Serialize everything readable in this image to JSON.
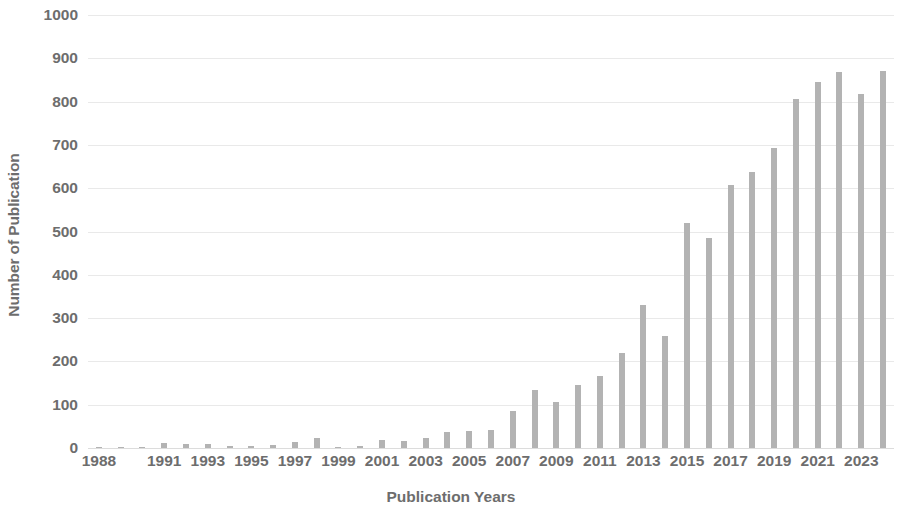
{
  "chart_data": {
    "type": "bar",
    "title": "",
    "xlabel": "Publication Years",
    "ylabel": "Number of Publication",
    "ylim": [
      0,
      1000
    ],
    "ytick_values": [
      0,
      100,
      200,
      300,
      400,
      500,
      600,
      700,
      800,
      900,
      1000
    ],
    "ytick_labels": [
      "0",
      "100",
      "200",
      "300",
      "400",
      "500",
      "600",
      "700",
      "800",
      "900",
      "1000"
    ],
    "grid": true,
    "legend": false,
    "bar_color": "#b3b3b3",
    "grid_color": "#e9e9e9",
    "text_color": "#6d6d6d",
    "categories": [
      "1988",
      "1989",
      "1990",
      "1991",
      "1992",
      "1993",
      "1994",
      "1995",
      "1996",
      "1997",
      "1998",
      "1999",
      "2000",
      "2001",
      "2002",
      "2003",
      "2004",
      "2005",
      "2006",
      "2007",
      "2008",
      "2009",
      "2010",
      "2011",
      "2012",
      "2013",
      "2014",
      "2015",
      "2016",
      "2017",
      "2018",
      "2019",
      "2020",
      "2021",
      "2022",
      "2023",
      "2024"
    ],
    "values": [
      1,
      1,
      2,
      12,
      10,
      9,
      4,
      5,
      6,
      14,
      22,
      3,
      4,
      18,
      16,
      24,
      38,
      40,
      42,
      85,
      133,
      107,
      145,
      167,
      220,
      330,
      259,
      520,
      484,
      607,
      637,
      694,
      806,
      845,
      868,
      818,
      870
    ],
    "last_value_note": "250",
    "xtick_labels": [
      "1988",
      "1991",
      "1993",
      "1995",
      "1997",
      "1999",
      "2001",
      "2003",
      "2005",
      "2007",
      "2009",
      "2011",
      "2013",
      "2015",
      "2017",
      "2019",
      "2021",
      "2023"
    ],
    "xtick_categories": [
      "1988",
      "1991",
      "1993",
      "1995",
      "1997",
      "1999",
      "2001",
      "2003",
      "2005",
      "2007",
      "2009",
      "2011",
      "2013",
      "2015",
      "2017",
      "2019",
      "2021",
      "2023"
    ]
  }
}
